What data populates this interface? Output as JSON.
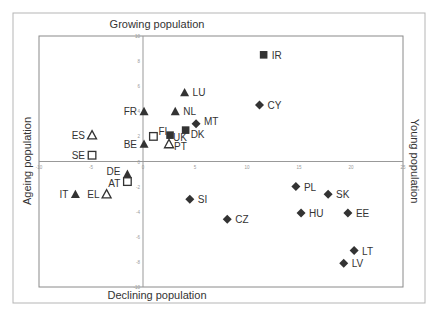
{
  "chart_data": {
    "type": "scatter",
    "title": "",
    "quadrant_labels": {
      "top": "Growing population",
      "bottom": "Declining population",
      "left": "Ageing population",
      "right": "Young population"
    },
    "xlim": [
      -10,
      25
    ],
    "ylim": [
      -10,
      10
    ],
    "x_ticks": [
      -10,
      -5,
      0,
      5,
      10,
      15,
      20,
      25
    ],
    "y_ticks": [
      -10,
      -8,
      -6,
      -4,
      -2,
      0,
      2,
      4,
      6,
      8,
      10
    ],
    "grid": false,
    "legend": null,
    "points": [
      {
        "label": "IR",
        "x": 11.6,
        "y": 8.5,
        "marker": "square-filled"
      },
      {
        "label": "CY",
        "x": 11.2,
        "y": 4.5,
        "marker": "diamond-filled"
      },
      {
        "label": "LU",
        "x": 4.0,
        "y": 5.5,
        "marker": "triangle-filled"
      },
      {
        "label": "FR",
        "x": 0.1,
        "y": 4.0,
        "marker": "triangle-filled"
      },
      {
        "label": "NL",
        "x": 3.1,
        "y": 4.0,
        "marker": "triangle-filled"
      },
      {
        "label": "MT",
        "x": 5.1,
        "y": 3.0,
        "marker": "diamond-filled"
      },
      {
        "label": "DK",
        "x": 4.1,
        "y": 2.5,
        "marker": "square-filled"
      },
      {
        "label": "FI",
        "x": 1.0,
        "y": 2.0,
        "marker": "square-open"
      },
      {
        "label": "UK",
        "x": 2.6,
        "y": 2.1,
        "marker": "square-filled"
      },
      {
        "label": "PT",
        "x": 2.5,
        "y": 1.4,
        "marker": "triangle-open"
      },
      {
        "label": "BE",
        "x": 0.1,
        "y": 1.4,
        "marker": "triangle-filled"
      },
      {
        "label": "ES",
        "x": -4.9,
        "y": 2.1,
        "marker": "triangle-open"
      },
      {
        "label": "SE",
        "x": -4.9,
        "y": 0.5,
        "marker": "square-open"
      },
      {
        "label": "DE",
        "x": -1.5,
        "y": -1.0,
        "marker": "triangle-filled"
      },
      {
        "label": "AT",
        "x": -1.5,
        "y": -1.6,
        "marker": "square-open"
      },
      {
        "label": "IT",
        "x": -6.5,
        "y": -2.6,
        "marker": "triangle-filled"
      },
      {
        "label": "EL",
        "x": -3.5,
        "y": -2.6,
        "marker": "triangle-open"
      },
      {
        "label": "SI",
        "x": 4.5,
        "y": -3.0,
        "marker": "diamond-filled"
      },
      {
        "label": "CZ",
        "x": 8.1,
        "y": -4.6,
        "marker": "diamond-filled"
      },
      {
        "label": "PL",
        "x": 14.7,
        "y": -2.0,
        "marker": "diamond-filled"
      },
      {
        "label": "SK",
        "x": 17.8,
        "y": -2.6,
        "marker": "diamond-filled"
      },
      {
        "label": "HU",
        "x": 15.2,
        "y": -4.1,
        "marker": "diamond-filled"
      },
      {
        "label": "EE",
        "x": 19.7,
        "y": -4.1,
        "marker": "diamond-filled"
      },
      {
        "label": "LT",
        "x": 20.3,
        "y": -7.1,
        "marker": "diamond-filled"
      },
      {
        "label": "LV",
        "x": 19.3,
        "y": -8.1,
        "marker": "diamond-filled"
      }
    ]
  },
  "colors": {
    "marker": "#333333",
    "axis": "#888888",
    "frame": "#aaaaaa",
    "text": "#333333"
  }
}
